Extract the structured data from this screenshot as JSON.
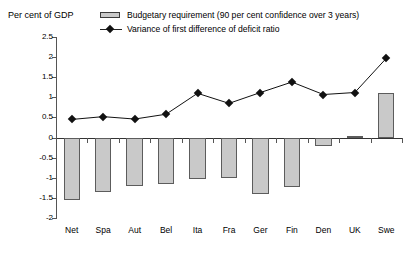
{
  "axis_title": "Per cent of GDP",
  "legend": {
    "position": "top",
    "entries": [
      {
        "key": "bar",
        "label": "Budgetary requirement (90 per cent confidence over 3 years)"
      },
      {
        "key": "line",
        "label": "Variance of first difference of deficit ratio"
      }
    ]
  },
  "chart_data": {
    "type": "bar",
    "title": "",
    "subtitle": "",
    "xlabel": "",
    "ylabel": "Per cent of GDP",
    "ylim": [
      -2,
      2.5
    ],
    "yticks": [
      2.5,
      2,
      1.5,
      1,
      0.5,
      0,
      -0.5,
      -1,
      -1.5,
      -2
    ],
    "ytick_labels": [
      "2.5",
      "2",
      "1.5",
      "1",
      "0.5",
      "0",
      "-0.5",
      "-1",
      "-1.5",
      "-2"
    ],
    "grid": false,
    "legend_position": "top",
    "categories": [
      "Net",
      "Spa",
      "Aut",
      "Bel",
      "Ita",
      "Fra",
      "Ger",
      "Fin",
      "Den",
      "UK",
      "Swe"
    ],
    "series": [
      {
        "name": "Budgetary requirement (90 per cent confidence over 3 years)",
        "type": "bar",
        "color": "#c9c9c9",
        "edge_color": "#5c5c5c",
        "values": [
          -1.55,
          -1.35,
          -1.2,
          -1.15,
          -1.02,
          -1.0,
          -1.4,
          -1.22,
          -0.2,
          0.05,
          1.1
        ]
      },
      {
        "name": "Variance of first difference of deficit ratio",
        "type": "line",
        "color": "#111111",
        "marker": "diamond",
        "values": [
          0.45,
          0.52,
          0.46,
          0.58,
          1.1,
          0.85,
          1.12,
          1.38,
          1.07,
          1.12,
          1.97
        ]
      }
    ]
  }
}
